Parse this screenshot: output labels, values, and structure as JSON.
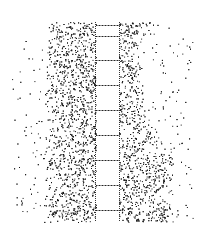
{
  "illustration": {
    "subject": "stippled path with ladder-like central strip",
    "frame": {
      "x": 12,
      "y": 22,
      "w": 181,
      "h": 200,
      "radius": 6
    },
    "strip": {
      "x1": 96,
      "x2": 119
    },
    "rungs_y": [
      25,
      36,
      60,
      85,
      110,
      135,
      160,
      185,
      210
    ],
    "colors": {
      "background": "#ffffff",
      "ink": "#111111"
    }
  }
}
